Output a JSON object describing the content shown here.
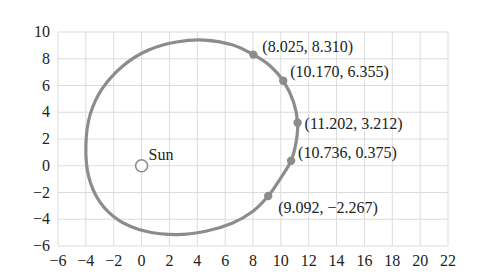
{
  "chart_data": {
    "type": "scatter",
    "title": "",
    "xlabel": "",
    "ylabel": "",
    "xlim": [
      -6,
      22
    ],
    "ylim": [
      -6,
      10
    ],
    "grid": true,
    "legend": null,
    "x_ticks": [
      -6,
      -4,
      -2,
      0,
      2,
      4,
      6,
      8,
      10,
      12,
      14,
      16,
      18,
      20,
      22
    ],
    "y_ticks": [
      -6,
      -4,
      -2,
      0,
      2,
      4,
      6,
      8,
      10
    ],
    "x_tick_labels": [
      "−6",
      "−4",
      "−2",
      "0",
      "2",
      "4",
      "6",
      "8",
      "10",
      "12",
      "14",
      "16",
      "18",
      "20",
      "22"
    ],
    "y_tick_labels": [
      "−6",
      "−4",
      "−2",
      "0",
      "2",
      "4",
      "6",
      "8",
      "10"
    ],
    "sun": {
      "label": "Sun",
      "x": 0,
      "y": 0
    },
    "series": [
      {
        "name": "labeled orbit positions",
        "points": [
          {
            "x": 8.025,
            "y": 8.31,
            "label": "(8.025, 8.310)"
          },
          {
            "x": 10.17,
            "y": 6.355,
            "label": "(10.170, 6.355)"
          },
          {
            "x": 11.202,
            "y": 3.212,
            "label": "(11.202, 3.212)"
          },
          {
            "x": 10.736,
            "y": 0.375,
            "label": "(10.736, 0.375)"
          },
          {
            "x": 9.092,
            "y": -2.267,
            "label": "(9.092, −2.267)"
          }
        ]
      }
    ],
    "approximate_orbit_points_note": "Closed curve traced by eye from the image through the five labeled points and the visible extremes; not a fitted conic.",
    "approximate_orbit_points": [
      [
        8.025,
        8.31
      ],
      [
        6.5,
        9.05
      ],
      [
        4.5,
        9.4
      ],
      [
        2.5,
        9.25
      ],
      [
        0.5,
        8.65
      ],
      [
        -1.3,
        7.5
      ],
      [
        -2.8,
        5.8
      ],
      [
        -3.7,
        3.8
      ],
      [
        -4.0,
        1.5
      ],
      [
        -3.8,
        -0.8
      ],
      [
        -3.0,
        -2.7
      ],
      [
        -1.6,
        -4.1
      ],
      [
        0.3,
        -4.9
      ],
      [
        2.5,
        -5.15
      ],
      [
        4.6,
        -4.9
      ],
      [
        6.5,
        -4.3
      ],
      [
        8.0,
        -3.4
      ],
      [
        9.092,
        -2.267
      ],
      [
        10.0,
        -0.9
      ],
      [
        10.736,
        0.375
      ],
      [
        11.1,
        1.8
      ],
      [
        11.202,
        3.212
      ],
      [
        10.9,
        4.8
      ],
      [
        10.17,
        6.355
      ],
      [
        9.2,
        7.5
      ]
    ],
    "colors": {
      "orbit": "#8c8c8c",
      "grid": "#dcdcdc",
      "text": "#222222"
    }
  }
}
